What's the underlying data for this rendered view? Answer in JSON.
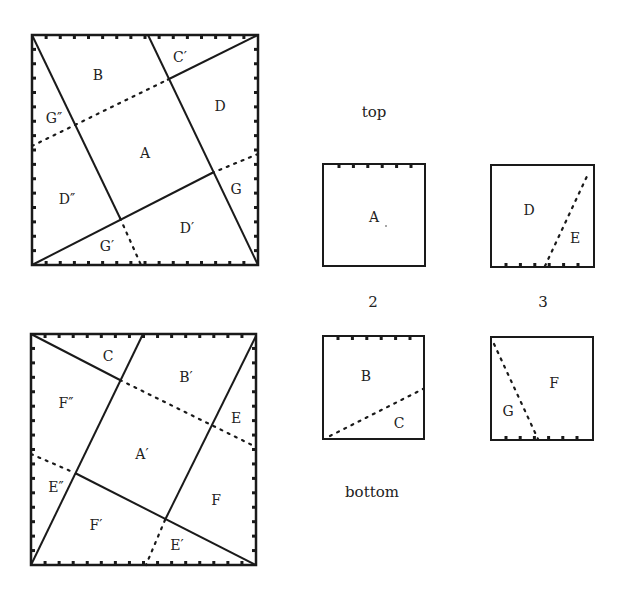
{
  "colors": {
    "ink": "#1a1a1a",
    "background": "#ffffff"
  },
  "captions": {
    "top": "top",
    "bottom": "bottom",
    "col2": "2",
    "col3": "3"
  },
  "big_top": {
    "labels": {
      "B": "B",
      "C_prime": "C′",
      "G_dprime": "G″",
      "D": "D",
      "A": "A",
      "G": "G",
      "D_dprime": "D″",
      "D_prime": "D′",
      "G_prime": "G′"
    }
  },
  "big_bottom": {
    "labels": {
      "C": "C",
      "B_prime": "B′",
      "F_dprime": "F″",
      "E": "E",
      "A_prime": "A′",
      "E_dprime": "E″",
      "F": "F",
      "F_prime": "F′",
      "E_prime": "E′"
    }
  },
  "small": {
    "top2": {
      "labels": {
        "A": "A"
      }
    },
    "top3": {
      "labels": {
        "D": "D",
        "E": "E"
      }
    },
    "bottom2": {
      "labels": {
        "B": "B",
        "C": "C"
      }
    },
    "bottom3": {
      "labels": {
        "F": "F",
        "G": "G"
      }
    }
  }
}
